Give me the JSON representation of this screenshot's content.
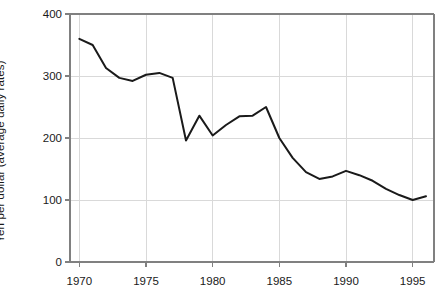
{
  "chart_data": {
    "type": "line",
    "title": "",
    "subtitle": "",
    "xlabel": "",
    "ylabel": "Yen per dollar (average daily rates)",
    "xlim": [
      1969.3,
      1996.6
    ],
    "ylim": [
      0,
      400
    ],
    "grid": true,
    "legend": "none",
    "x_ticks": [
      1970,
      1975,
      1980,
      1985,
      1990,
      1995
    ],
    "x_tick_labels": [
      "1970",
      "1975",
      "1980",
      "1985",
      "1990",
      "1995"
    ],
    "y_ticks": [
      0,
      100,
      200,
      300,
      400
    ],
    "y_tick_labels": [
      "0",
      "100",
      "200",
      "300",
      "400"
    ],
    "line_color": "#1a1a1a",
    "line_width": 2.0,
    "grid_color": "#d9d9d9",
    "axis_color": "#808080",
    "series": [
      {
        "name": "Yen per dollar",
        "x": [
          1970,
          1971,
          1972,
          1973,
          1974,
          1975,
          1976,
          1977,
          1978,
          1979,
          1980,
          1981,
          1982,
          1983,
          1984,
          1985,
          1986,
          1987,
          1988,
          1989,
          1990,
          1991,
          1992,
          1993,
          1994,
          1995,
          1996
        ],
        "values": [
          360,
          350,
          313,
          297,
          292,
          302,
          305,
          297,
          196,
          236,
          204,
          221,
          235,
          236,
          250,
          200,
          168,
          145,
          134,
          138,
          147,
          140,
          131,
          118,
          108,
          100,
          106
        ]
      }
    ]
  },
  "axis_labels": {
    "y_axis_title": "Yen per dollar (average daily rates)"
  }
}
